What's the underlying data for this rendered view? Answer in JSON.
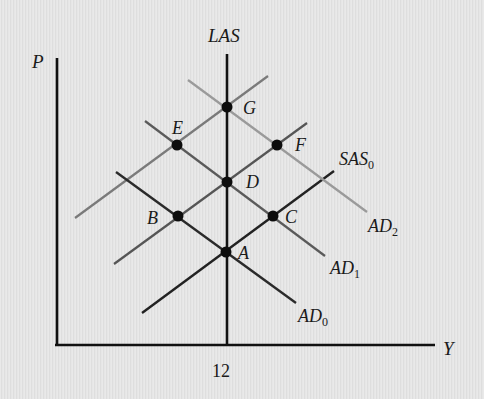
{
  "diagram": {
    "axes": {
      "y_label": "P",
      "x_label": "Y",
      "x_tick": "12"
    },
    "curves": {
      "las": {
        "label": "LAS",
        "color": "#111111"
      },
      "sas0": {
        "label": "SAS",
        "subscript": "0",
        "color": "#222222"
      },
      "sas1": {
        "label": "",
        "color": "#555555"
      },
      "sas2": {
        "label": "",
        "color": "#7a7a7a"
      },
      "ad0": {
        "label": "AD",
        "subscript": "0",
        "color": "#2a2a2a"
      },
      "ad1": {
        "label": "AD",
        "subscript": "1",
        "color": "#5a5a5a"
      },
      "ad2": {
        "label": "AD",
        "subscript": "2",
        "color": "#9a9a9a"
      }
    },
    "points": [
      {
        "id": "A",
        "label": "A"
      },
      {
        "id": "B",
        "label": "B"
      },
      {
        "id": "C",
        "label": "C"
      },
      {
        "id": "D",
        "label": "D"
      },
      {
        "id": "E",
        "label": "E"
      },
      {
        "id": "F",
        "label": "F"
      },
      {
        "id": "G",
        "label": "G"
      }
    ],
    "colors": {
      "axis": "#111111",
      "point": "#0d0d0d",
      "background": "#e4e4e4"
    }
  }
}
